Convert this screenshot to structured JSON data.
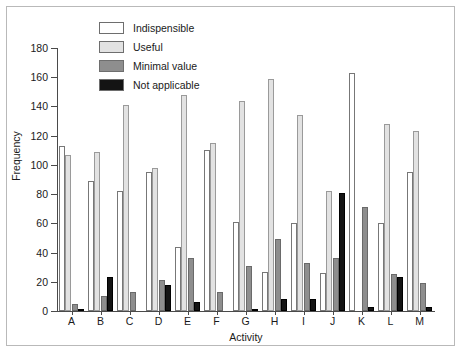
{
  "chart_data": {
    "type": "bar",
    "title": "",
    "xlabel": "Activity",
    "ylabel": "Frequency",
    "ylim": [
      0,
      180
    ],
    "yticks": [
      0,
      20,
      40,
      60,
      80,
      100,
      120,
      140,
      160,
      180
    ],
    "grid": false,
    "legend_position": "top-center-inside",
    "categories": [
      "A",
      "B",
      "C",
      "D",
      "E",
      "F",
      "G",
      "H",
      "I",
      "J",
      "K",
      "L",
      "M"
    ],
    "series": [
      {
        "name": "Indispensible",
        "color": "#ffffff",
        "values": [
          113,
          89,
          82,
          95,
          44,
          110,
          61,
          27,
          60,
          26,
          163,
          60,
          95
        ]
      },
      {
        "name": "Useful",
        "color": "#e2e2e2",
        "values": [
          107,
          109,
          141,
          98,
          148,
          115,
          144,
          159,
          134,
          82,
          0,
          128,
          123
        ]
      },
      {
        "name": "Minimal value",
        "color": "#8e8e8e",
        "values": [
          5,
          10,
          13,
          21,
          36,
          13,
          31,
          49,
          33,
          36,
          71,
          25,
          19
        ]
      },
      {
        "name": "Not applicable",
        "color": "#141414",
        "values": [
          1,
          23,
          0,
          18,
          6,
          0,
          1,
          8,
          8,
          81,
          3,
          23,
          3
        ]
      }
    ]
  },
  "legend": {
    "items": [
      {
        "label": "Indispensible"
      },
      {
        "label": "Useful"
      },
      {
        "label": "Minimal value"
      },
      {
        "label": "Not applicable"
      }
    ]
  },
  "axes": {
    "y_title": "Frequency",
    "x_title": "Activity"
  }
}
